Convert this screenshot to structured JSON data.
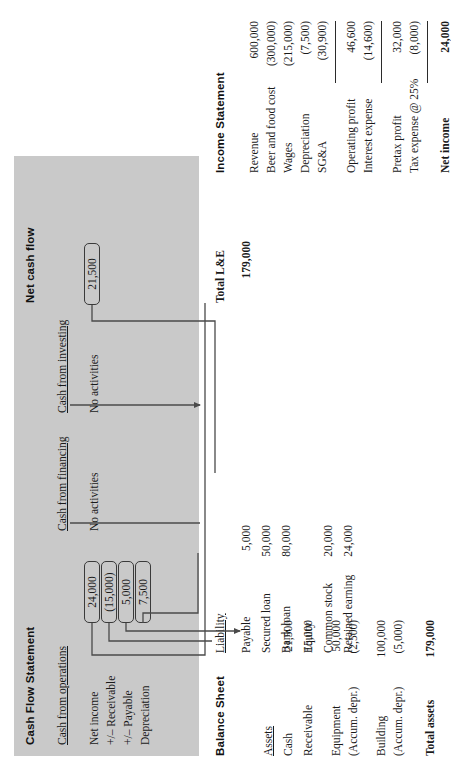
{
  "figure": {
    "type": "financial-statement-flow-diagram",
    "orientation": "rotated-90-ccw",
    "panel_color": "#c9c9c9",
    "line_color": "#4a4a4a"
  },
  "income_statement": {
    "title": "Income Statement",
    "rows": [
      {
        "label": "Revenue",
        "value": "600,000"
      },
      {
        "label": "Beer and food cost",
        "value": "(300,000)"
      },
      {
        "label": "Wages",
        "value": "(215,000)"
      },
      {
        "label": "Depreciation",
        "value": "(7,500)"
      },
      {
        "label": "SG&A",
        "value": "(30,900)"
      }
    ],
    "subtotal1": [
      {
        "label": "Operating profit",
        "value": "46,600"
      },
      {
        "label": "Interest expense",
        "value": "(14,600)"
      }
    ],
    "subtotal2": [
      {
        "label": "Pretax profit",
        "value": "32,000"
      },
      {
        "label": "Tax expense @ 25%",
        "value": "(8,000)"
      }
    ],
    "total": {
      "label": "Net income",
      "value": "24,000"
    }
  },
  "balance_sheet": {
    "title": "Balance Sheet",
    "assets_header": "Assets",
    "assets": [
      {
        "label": "Cash",
        "value": "21,500"
      },
      {
        "label": "Receivable",
        "value": "15,000"
      },
      {
        "label": "Equipment",
        "value": "50,000"
      },
      {
        "label": "(Accum. depr.)",
        "value": "(2,500)"
      },
      {
        "label": "Building",
        "value": "100,000"
      },
      {
        "label": "(Accum. depr.)",
        "value": "(5,000)"
      }
    ],
    "assets_total": {
      "label": "Total assets",
      "value": "179,000"
    },
    "liability_header": "Liability",
    "liabilities": [
      {
        "label": "Payable",
        "value": "5,000"
      },
      {
        "label": "Secured loan",
        "value": "50,000"
      },
      {
        "label": "Bank loan",
        "value": "80,000"
      }
    ],
    "equity_header": "Equity",
    "equity": [
      {
        "label": "Common stock",
        "value": "20,000"
      },
      {
        "label": "Retained earning",
        "value": "24,000"
      }
    ],
    "le_total": {
      "label": "Total L&E",
      "value": "179,000"
    }
  },
  "cash_flow_statement": {
    "title": "Cash Flow Statement",
    "operations_header": "Cash from operations",
    "operations": [
      {
        "label": "Net income",
        "value": "24,000"
      },
      {
        "label": "+/– Receivable",
        "value": "(15,000)"
      },
      {
        "label": "+/– Payable",
        "value": "5,000"
      },
      {
        "label": "Depreciation",
        "value": "7,500"
      }
    ],
    "financing_header": "Cash from financing",
    "financing_note": "No activities",
    "investing_header": "Cash from investing",
    "investing_note": "No activities",
    "net": {
      "label": "Net cash flow",
      "value": "21,500"
    }
  }
}
